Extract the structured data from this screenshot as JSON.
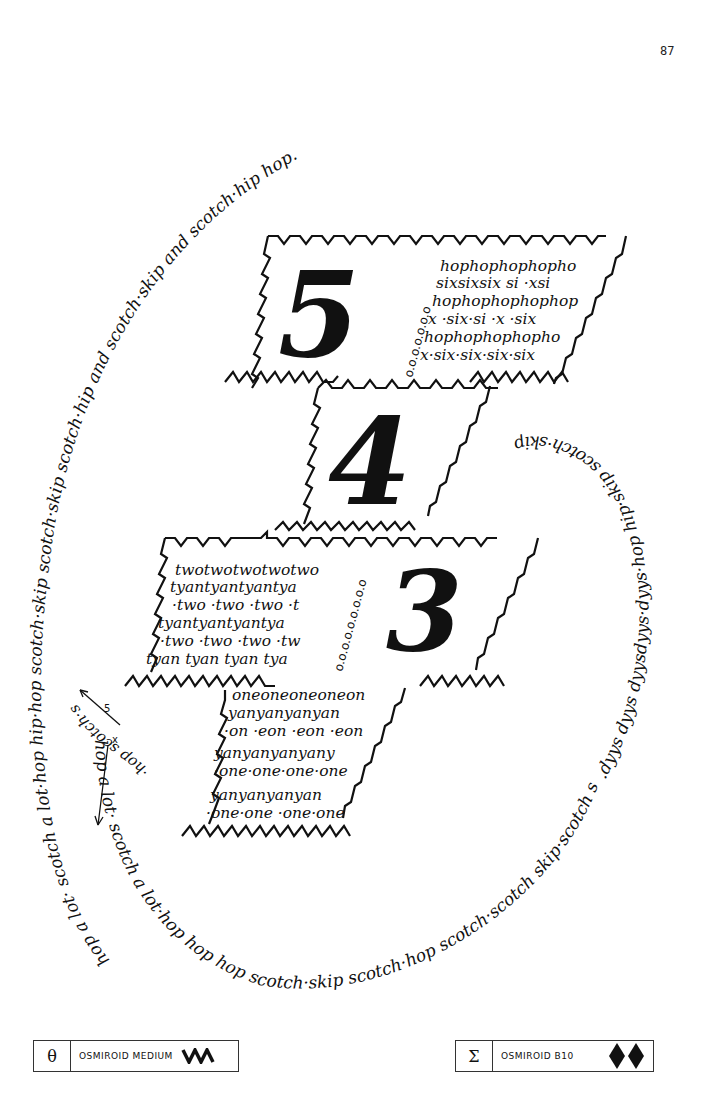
{
  "page": {
    "number": "87"
  },
  "spiral": {
    "outer_text": "hop a lot· scotch a lot·hop hip·hop scotch·skip scotch·skip scotch·hip and scotch·skip and scotch·hip hop.",
    "inner_text": ".dyys dyys dyysdyys·dyys·hop hip·skip scotch·skip scotch skip·hip & scotch·hop e scotch·skip skipship.",
    "lower_text": "hop a lot· scotch a lot·hop hop hop scotch·skip scotch·hop scotch·scotch skip·scotch skip·hip",
    "left_text": "skip scotch·hop a lot·scotch a lot·hop hip·hop",
    "inner_left_text": "·hop scotch·skip",
    "arrow_marks": [
      "5",
      "x"
    ]
  },
  "hopscotch": {
    "squares": [
      {
        "number": "5",
        "dots": "o.o.o.o.o.o.o",
        "pattern_lines": [
          "hophophophopho",
          "sixsixsix si ·xsi",
          "hophophophophop",
          "x ·six·si ·x ·six",
          "hophophophopho",
          "x·six·six·six·six"
        ]
      },
      {
        "number": "4",
        "pattern_lines": []
      },
      {
        "number": "3",
        "dots": "o.o.o.o.o.o.o.o.o",
        "pattern_lines": [
          "twotwotwotwotwo",
          "tyantyantyantya",
          "·two ·two ·two ·t",
          "tyantyantyantya",
          "·two ·two ·two ·tw",
          "tyan tyan tyan tya"
        ]
      },
      {
        "number": "",
        "pattern_lines": [
          "oneoneoneoneon",
          "yanyanyanyan",
          "·on ·eon ·eon ·eon",
          "yanyanyanyany",
          "·one·one·one·one",
          "yanyanyanyan",
          "·one·one ·one·one"
        ]
      }
    ]
  },
  "legend": {
    "left": {
      "symbol": "θ",
      "label": "Osmiroid Medium",
      "glyph": "zigzag-icon"
    },
    "right": {
      "symbol": "Σ",
      "label": "Osmiroid B10",
      "glyph": "double-diamond-icon"
    }
  }
}
